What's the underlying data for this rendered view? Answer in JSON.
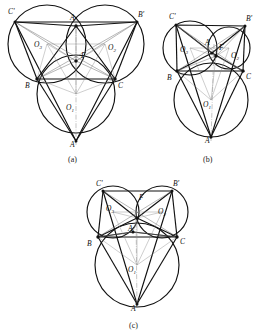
{
  "figure": {
    "stroke_color": "#111111",
    "thin_color": "#8a8a8a",
    "background": "#ffffff"
  },
  "panels": [
    {
      "id": "a",
      "caption": "(a)",
      "labels": {
        "A": "A",
        "B": "B",
        "C": "C",
        "Aprime": "A'",
        "Bprime": "B'",
        "Cprime": "C'",
        "F": "F",
        "O1": "O",
        "O1sub": "1",
        "O2": "O",
        "O2sub": "2",
        "O3": "O",
        "O3sub": "3"
      }
    },
    {
      "id": "b",
      "caption": "(b)",
      "labels": {
        "A": "A",
        "B": "B",
        "C": "C",
        "Aprime": "A'",
        "Bprime": "B'",
        "Cprime": "C'",
        "F": "F",
        "O1": "O",
        "O1sub": "1",
        "O2": "O",
        "O2sub": "2",
        "O3": "O",
        "O3sub": "3"
      }
    },
    {
      "id": "c",
      "caption": "(c)",
      "labels": {
        "A": "A",
        "B": "B",
        "C": "C",
        "Aprime": "A'",
        "Bprime": "B'",
        "Cprime": "C'",
        "F": "F",
        "O1": "O",
        "O1sub": "1",
        "O2": "O",
        "O2sub": "2",
        "O3": "O",
        "O3sub": "3"
      }
    }
  ]
}
